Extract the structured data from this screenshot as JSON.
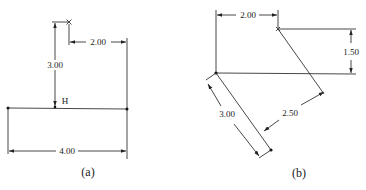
{
  "figures": [
    {
      "id": "a",
      "caption": "(a)",
      "point_label": "H",
      "dimensions": {
        "vertical": "3.00",
        "horizontal_top": "2.00",
        "horizontal_bottom": "4.00"
      }
    },
    {
      "id": "b",
      "caption": "(b)",
      "dimensions": {
        "horizontal_top": "2.00",
        "vertical_right": "1.50",
        "diagonal_left": "3.00",
        "diagonal_right": "2.50"
      }
    }
  ],
  "colors": {
    "line": "#333333",
    "text": "#222222",
    "background": "#ffffff"
  }
}
